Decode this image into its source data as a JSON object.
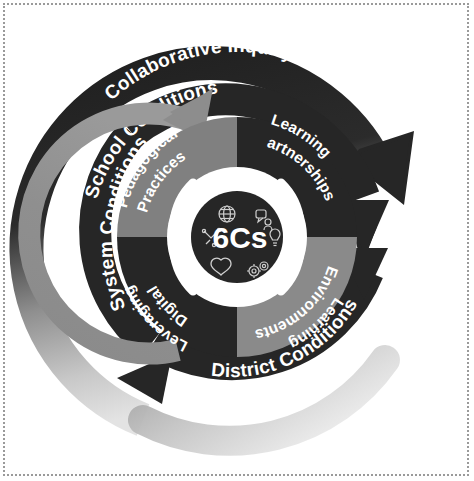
{
  "diagram": {
    "core": {
      "label": "6Cs",
      "icons": [
        "globe-icon",
        "communication-icon",
        "critical-thinking-icon",
        "creativity-lightbulb-icon",
        "character-heart-icon",
        "collaboration-gears-icon"
      ]
    },
    "outer_ring": {
      "name": "collaborative-inquiry-ring",
      "label": "Collaborative Inquiry",
      "color": "#2b2b2b",
      "fade_color": "#d2d2d2",
      "arrow_direction": "clockwise"
    },
    "middle_rings": [
      {
        "name": "school-conditions-ring",
        "label": "School Conditions",
        "color": "#262626",
        "arrow_direction": "clockwise"
      },
      {
        "name": "district-conditions-ring",
        "label": "District Conditions",
        "color": "#262626",
        "arrow_direction": "clockwise"
      },
      {
        "name": "system-conditions-ring",
        "label": "System Conditions",
        "color": "#262626",
        "arrow_direction": "clockwise"
      }
    ],
    "inner_arc": {
      "name": "system-conditions-arc",
      "color": "#8a8a8a",
      "arrow_direction": "clockwise"
    },
    "quadrants": [
      {
        "name": "pedagogical-practices-quadrant",
        "label": "Pedagogical Practices",
        "label_line1": "Pedagogical",
        "label_line2": "Practices",
        "color": "#808080",
        "position": "top-left"
      },
      {
        "name": "learning-partnerships-quadrant",
        "label": "Learning Partnerships",
        "label_line1": "Learning",
        "label_line2": "Partnerships",
        "color": "#262626",
        "position": "top-right"
      },
      {
        "name": "learning-environments-quadrant",
        "label": "Learning Environments",
        "label_line1": "Learning",
        "label_line2": "Environments",
        "color": "#8a8a8a",
        "position": "bottom-right"
      },
      {
        "name": "leveraging-digital-quadrant",
        "label": "Leveraging Digital",
        "label_line1": "Leveraging",
        "label_line2": "Digital",
        "color": "#262626",
        "position": "bottom-left"
      }
    ],
    "colors": {
      "dark": "#262626",
      "mid_gray": "#808080",
      "light_gray": "#c9c9c9",
      "white": "#ffffff",
      "border": "#9a9a9a"
    }
  }
}
